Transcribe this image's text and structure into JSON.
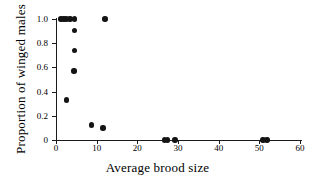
{
  "chart_data": {
    "type": "scatter",
    "title": "",
    "xlabel": "Average brood size",
    "ylabel": "Proportion of winged males",
    "xlim": [
      0,
      60
    ],
    "ylim": [
      0,
      1.0
    ],
    "xticks": [
      0,
      10,
      20,
      30,
      40,
      50,
      60
    ],
    "xticklabels": [
      "0",
      "10",
      "20",
      "30",
      "40",
      "50",
      "60"
    ],
    "yticks": [
      0,
      0.2,
      0.4,
      0.6,
      0.8,
      1.0
    ],
    "yticklabels": [
      "0",
      "0.2",
      "0.4",
      "0.6",
      "0.8",
      "1.0"
    ],
    "grid": false,
    "legend": null,
    "marker": "filled-circle",
    "marker_color": "#141414",
    "points": [
      {
        "x": 1.2,
        "y": 1.0
      },
      {
        "x": 2.0,
        "y": 1.0
      },
      {
        "x": 2.6,
        "y": 1.0
      },
      {
        "x": 3.4,
        "y": 1.0
      },
      {
        "x": 4.6,
        "y": 1.0
      },
      {
        "x": 12.0,
        "y": 1.0
      },
      {
        "x": 4.5,
        "y": 0.905
      },
      {
        "x": 4.5,
        "y": 0.74
      },
      {
        "x": 4.4,
        "y": 0.57
      },
      {
        "x": 2.6,
        "y": 0.33
      },
      {
        "x": 8.8,
        "y": 0.125
      },
      {
        "x": 11.6,
        "y": 0.1
      },
      {
        "x": 26.7,
        "y": 0.0
      },
      {
        "x": 27.4,
        "y": 0.0
      },
      {
        "x": 29.3,
        "y": 0.0
      },
      {
        "x": 50.9,
        "y": 0.0
      },
      {
        "x": 51.9,
        "y": 0.0
      }
    ]
  },
  "axes": {
    "x_title": "Average brood size",
    "y_title": "Proportion of winged males"
  }
}
